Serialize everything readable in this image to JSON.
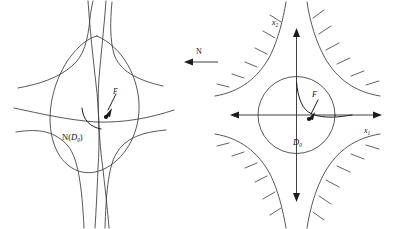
{
  "figure": {
    "type": "mathematical-diagram",
    "panels": [
      {
        "id": "left",
        "name": "image-panel",
        "label": "N(D_0)",
        "label_main": "N",
        "label_paren_open": "(",
        "label_base": "D",
        "label_sub": "0",
        "label_paren_close": ")",
        "curve_label": "F",
        "description": "Distorted lens-shaped image of the disc D0 under N, with four curved separatrix branches",
        "has_axes": false,
        "has_hatching": false
      },
      {
        "id": "right",
        "name": "source-panel",
        "label": "D_0",
        "label_base": "D",
        "label_sub": "0",
        "curve_label": "F",
        "axis_x_label_base": "x",
        "axis_x_label_sub": "1",
        "axis_y_label_base": "x",
        "axis_y_label_sub": "2",
        "description": "Round disc D0 centred at the saddle point with coordinate axes x1, x2 and four hyperbolic branches carrying hatch marks on their outer sides",
        "has_axes": true,
        "has_hatching": true
      }
    ],
    "connector": {
      "name": "map-arrow",
      "label": "N",
      "direction": "left"
    },
    "colors": {
      "stroke": "#3a3a3a",
      "stroke_dark": "#1d1d1d",
      "axis": "#2b2b2b",
      "text": "#111111",
      "background": "#ffffff"
    }
  }
}
